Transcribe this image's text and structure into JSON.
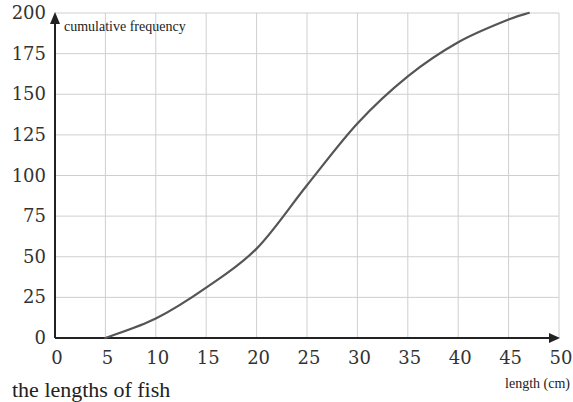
{
  "chart_data": {
    "type": "line",
    "title": "",
    "ylabel": "cumulative frequency",
    "xlabel": "length (cm)",
    "xlim": [
      0,
      50
    ],
    "ylim": [
      0,
      200
    ],
    "x_ticks": [
      0,
      5,
      10,
      15,
      20,
      25,
      30,
      35,
      40,
      45,
      50
    ],
    "y_ticks": [
      0,
      25,
      50,
      75,
      100,
      125,
      150,
      175,
      200
    ],
    "grid": true,
    "legend": null,
    "series": [
      {
        "name": "cumulative frequency",
        "x": [
          5,
          10,
          15,
          20,
          25,
          30,
          35,
          40,
          45,
          47
        ],
        "values": [
          0,
          12,
          31,
          55,
          94,
          132,
          161,
          182,
          196,
          200
        ]
      }
    ]
  },
  "caption": "the lengths of fish"
}
